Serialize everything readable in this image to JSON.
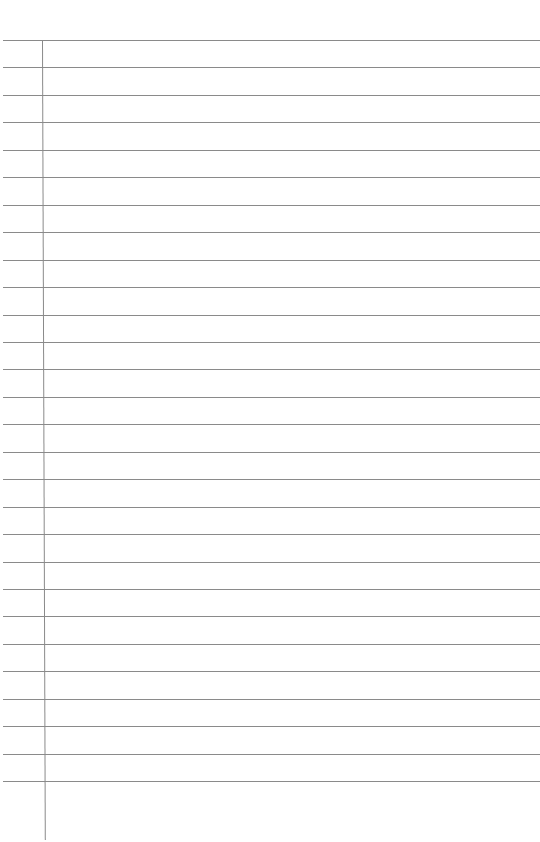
{
  "page": {
    "type": "lined-paper",
    "rule_color": "#8a8a8a",
    "background_color": "#ffffff",
    "line_count": 28,
    "first_line_y": 40,
    "line_spacing": 27.45,
    "margin_x": 42,
    "margin_end_y": 840
  }
}
